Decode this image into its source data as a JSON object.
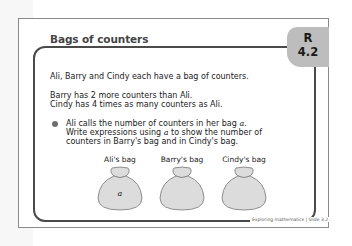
{
  "slide": {
    "title": "Bags of counters",
    "tab": {
      "letter": "R",
      "number": "4.2"
    },
    "intro": "Ali, Barry and Cindy each have a bag of counters.",
    "facts": [
      "Barry has 2 more counters than Ali.",
      "Cindy has 4 times as many counters as Ali."
    ],
    "bullet": {
      "line1_pre": "Ali calls the number of counters in her bag ",
      "var": "a",
      "line1_post": ".",
      "line2_pre": "Write expressions using ",
      "line2_post": " to show the number of",
      "line3": "counters in Barry's bag and in Cindy's bag."
    },
    "bags": [
      {
        "label": "Ali's bag",
        "content": "a"
      },
      {
        "label": "Barry's bag",
        "content": ""
      },
      {
        "label": "Cindy's bag",
        "content": ""
      }
    ],
    "footer": "Exploring mathematics | Slide 3.2",
    "colors": {
      "tab": "#bdbdbd",
      "border": "#4a4a4a",
      "bag_fill": "#dcdcdc"
    }
  }
}
